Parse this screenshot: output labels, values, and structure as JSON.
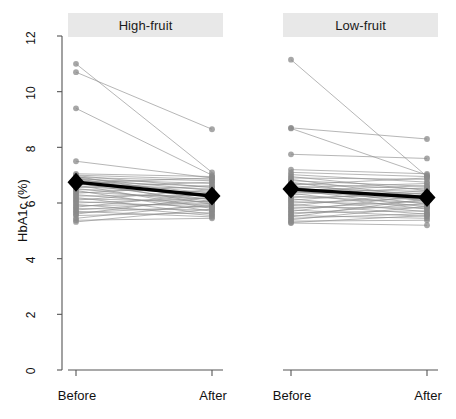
{
  "figure": {
    "ylabel": "HbA1c (%)",
    "y_ticks": [
      "0",
      "2",
      "4",
      "6",
      "8",
      "10",
      "12"
    ],
    "x_ticks": [
      "Before",
      "After"
    ],
    "panel_titles": [
      "High-fruit",
      "Low-fruit"
    ],
    "colors": {
      "individual_line": "#8c8c8c",
      "point": "#8a8a8a",
      "mean_marker": "#000000",
      "strip_bg": "#e8e8e8",
      "axis": "#555555",
      "background": "#ffffff"
    }
  },
  "chart_data": {
    "type": "line",
    "title": "",
    "subtitle": "",
    "xlabel": "",
    "ylabel": "HbA1c (%)",
    "x": [
      "Before",
      "After"
    ],
    "ylim": [
      0,
      12.4
    ],
    "yticks": [
      0,
      2,
      4,
      6,
      8,
      10,
      12
    ],
    "grid": false,
    "legend": "none",
    "panel_layout": "1x2",
    "annotations": [
      "Black diamonds joined by a thick line denote group mean HbA1c at each time point.",
      "Thin grey lines with grey circular markers are individual participant trajectories."
    ],
    "panels": [
      {
        "title": "High-fruit",
        "mean": {
          "name": "Group mean",
          "values": [
            6.75,
            6.25
          ],
          "marker": "diamond",
          "color": "#000000"
        },
        "series": [
          {
            "name": "p1",
            "values": [
              11.0,
              7.1
            ]
          },
          {
            "name": "p2",
            "values": [
              10.7,
              8.65
            ]
          },
          {
            "name": "p3",
            "values": [
              9.4,
              7.0
            ]
          },
          {
            "name": "p4",
            "values": [
              7.5,
              6.9
            ]
          },
          {
            "name": "p5",
            "values": [
              7.05,
              6.95
            ]
          },
          {
            "name": "p6",
            "values": [
              7.0,
              6.85
            ]
          },
          {
            "name": "p7",
            "values": [
              6.98,
              6.55
            ]
          },
          {
            "name": "p8",
            "values": [
              6.95,
              6.2
            ]
          },
          {
            "name": "p9",
            "values": [
              6.92,
              6.8
            ]
          },
          {
            "name": "p10",
            "values": [
              6.9,
              6.45
            ]
          },
          {
            "name": "p11",
            "values": [
              6.88,
              6.1
            ]
          },
          {
            "name": "p12",
            "values": [
              6.85,
              6.7
            ]
          },
          {
            "name": "p13",
            "values": [
              6.83,
              6.35
            ]
          },
          {
            "name": "p14",
            "values": [
              6.8,
              5.95
            ]
          },
          {
            "name": "p15",
            "values": [
              6.78,
              6.6
            ]
          },
          {
            "name": "p16",
            "values": [
              6.75,
              6.25
            ]
          },
          {
            "name": "p17",
            "values": [
              6.72,
              6.9
            ]
          },
          {
            "name": "p18",
            "values": [
              6.7,
              6.05
            ]
          },
          {
            "name": "p19",
            "values": [
              6.68,
              6.5
            ]
          },
          {
            "name": "p20",
            "values": [
              6.65,
              5.8
            ]
          },
          {
            "name": "p21",
            "values": [
              6.6,
              6.3
            ]
          },
          {
            "name": "p22",
            "values": [
              6.55,
              6.75
            ]
          },
          {
            "name": "p23",
            "values": [
              6.52,
              6.0
            ]
          },
          {
            "name": "p24",
            "values": [
              6.48,
              6.4
            ]
          },
          {
            "name": "p25",
            "values": [
              6.45,
              5.7
            ]
          },
          {
            "name": "p26",
            "values": [
              6.4,
              6.15
            ]
          },
          {
            "name": "p27",
            "values": [
              6.35,
              6.62
            ]
          },
          {
            "name": "p28",
            "values": [
              6.3,
              5.9
            ]
          },
          {
            "name": "p29",
            "values": [
              6.25,
              6.28
            ]
          },
          {
            "name": "p30",
            "values": [
              6.2,
              5.6
            ]
          },
          {
            "name": "p31",
            "values": [
              6.15,
              6.05
            ]
          },
          {
            "name": "p32",
            "values": [
              6.1,
              6.48
            ]
          },
          {
            "name": "p33",
            "values": [
              6.05,
              5.85
            ]
          },
          {
            "name": "p34",
            "values": [
              6.0,
              6.18
            ]
          },
          {
            "name": "p35",
            "values": [
              5.95,
              5.55
            ]
          },
          {
            "name": "p36",
            "values": [
              5.9,
              5.98
            ]
          },
          {
            "name": "p37",
            "values": [
              5.85,
              6.35
            ]
          },
          {
            "name": "p38",
            "values": [
              5.8,
              5.75
            ]
          },
          {
            "name": "p39",
            "values": [
              5.75,
              6.08
            ]
          },
          {
            "name": "p40",
            "values": [
              5.7,
              5.5
            ]
          },
          {
            "name": "p41",
            "values": [
              5.65,
              5.88
            ]
          },
          {
            "name": "p42",
            "values": [
              5.6,
              6.22
            ]
          },
          {
            "name": "p43",
            "values": [
              5.55,
              5.65
            ]
          },
          {
            "name": "p44",
            "values": [
              5.45,
              5.95
            ]
          },
          {
            "name": "p45",
            "values": [
              5.38,
              5.45
            ]
          },
          {
            "name": "p46",
            "values": [
              5.32,
              5.78
            ]
          }
        ]
      },
      {
        "title": "Low-fruit",
        "mean": {
          "name": "Group mean",
          "values": [
            6.5,
            6.2
          ],
          "marker": "diamond",
          "color": "#000000"
        },
        "series": [
          {
            "name": "q1",
            "values": [
              11.15,
              6.95
            ]
          },
          {
            "name": "q2",
            "values": [
              8.7,
              8.3
            ]
          },
          {
            "name": "q3",
            "values": [
              8.68,
              7.0
            ]
          },
          {
            "name": "q4",
            "values": [
              7.75,
              7.6
            ]
          },
          {
            "name": "q5",
            "values": [
              7.2,
              7.05
            ]
          },
          {
            "name": "q6",
            "values": [
              7.1,
              6.95
            ]
          },
          {
            "name": "q7",
            "values": [
              7.02,
              6.75
            ]
          },
          {
            "name": "q8",
            "values": [
              6.95,
              6.45
            ]
          },
          {
            "name": "q9",
            "values": [
              6.9,
              6.85
            ]
          },
          {
            "name": "q10",
            "values": [
              6.85,
              6.2
            ]
          },
          {
            "name": "q11",
            "values": [
              6.8,
              6.6
            ]
          },
          {
            "name": "q12",
            "values": [
              6.75,
              6.05
            ]
          },
          {
            "name": "q13",
            "values": [
              6.7,
              6.5
            ]
          },
          {
            "name": "q14",
            "values": [
              6.65,
              6.9
            ]
          },
          {
            "name": "q15",
            "values": [
              6.62,
              6.3
            ]
          },
          {
            "name": "q16",
            "values": [
              6.58,
              5.95
            ]
          },
          {
            "name": "q17",
            "values": [
              6.55,
              6.7
            ]
          },
          {
            "name": "q18",
            "values": [
              6.52,
              6.22
            ]
          },
          {
            "name": "q19",
            "values": [
              6.5,
              6.42
            ]
          },
          {
            "name": "q20",
            "values": [
              6.48,
              5.85
            ]
          },
          {
            "name": "q21",
            "values": [
              6.45,
              6.62
            ]
          },
          {
            "name": "q22",
            "values": [
              6.42,
              6.1
            ]
          },
          {
            "name": "q23",
            "values": [
              6.38,
              6.35
            ]
          },
          {
            "name": "q24",
            "values": [
              6.35,
              5.78
            ]
          },
          {
            "name": "q25",
            "values": [
              6.3,
              6.55
            ]
          },
          {
            "name": "q26",
            "values": [
              6.25,
              6.0
            ]
          },
          {
            "name": "q27",
            "values": [
              6.2,
              6.28
            ]
          },
          {
            "name": "q28",
            "values": [
              6.15,
              5.68
            ]
          },
          {
            "name": "q29",
            "values": [
              6.1,
              6.45
            ]
          },
          {
            "name": "q30",
            "values": [
              6.05,
              5.92
            ]
          },
          {
            "name": "q31",
            "values": [
              6.0,
              6.18
            ]
          },
          {
            "name": "q32",
            "values": [
              5.95,
              5.6
            ]
          },
          {
            "name": "q33",
            "values": [
              5.9,
              6.38
            ]
          },
          {
            "name": "q34",
            "values": [
              5.85,
              5.82
            ]
          },
          {
            "name": "q35",
            "values": [
              5.8,
              6.08
            ]
          },
          {
            "name": "q36",
            "values": [
              5.75,
              5.52
            ]
          },
          {
            "name": "q37",
            "values": [
              5.7,
              6.3
            ]
          },
          {
            "name": "q38",
            "values": [
              5.65,
              5.72
            ]
          },
          {
            "name": "q39",
            "values": [
              5.6,
              5.98
            ]
          },
          {
            "name": "q40",
            "values": [
              5.55,
              5.45
            ]
          },
          {
            "name": "q41",
            "values": [
              5.5,
              6.15
            ]
          },
          {
            "name": "q42",
            "values": [
              5.45,
              5.62
            ]
          },
          {
            "name": "q43",
            "values": [
              5.4,
              5.88
            ]
          },
          {
            "name": "q44",
            "values": [
              5.35,
              5.38
            ]
          },
          {
            "name": "q45",
            "values": [
              5.3,
              5.55
            ]
          },
          {
            "name": "q46",
            "values": [
              5.28,
              5.2
            ]
          }
        ]
      }
    ]
  }
}
